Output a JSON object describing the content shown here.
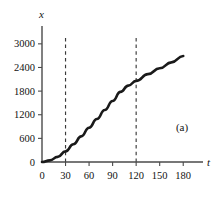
{
  "figure": {
    "panel_label": "(a)",
    "background_color": "#ffffff",
    "curve_color": "#1a1a1a",
    "axis_color": "#4a4a4a",
    "marker_color": "#3a3a3a"
  },
  "chart_data": {
    "type": "line",
    "title": "",
    "subtitle": "",
    "xlabel": "t",
    "ylabel": "x",
    "annotation": "(a)",
    "grid": false,
    "legend": false,
    "legend_position": "none",
    "xlim": [
      0,
      195
    ],
    "ylim": [
      0,
      3250
    ],
    "xticks": [
      0,
      30,
      60,
      90,
      120,
      150,
      180
    ],
    "xtick_labels": [
      "0",
      "30",
      "60",
      "90",
      "120",
      "150",
      "180"
    ],
    "yticks": [
      0,
      600,
      1200,
      1800,
      2400,
      3000
    ],
    "ytick_labels": [
      "0",
      "600",
      "1200",
      "1800",
      "2400",
      "3000"
    ],
    "series": [
      {
        "name": "x(t)",
        "x": [
          0,
          10,
          20,
          30,
          40,
          50,
          60,
          70,
          80,
          90,
          100,
          110,
          120,
          135,
          150,
          165,
          180
        ],
        "values": [
          0,
          40,
          130,
          270,
          450,
          650,
          870,
          1090,
          1320,
          1550,
          1780,
          1940,
          2060,
          2230,
          2380,
          2530,
          2690
        ]
      }
    ],
    "vertical_markers": [
      {
        "x": 30,
        "style": "dashed",
        "y_top": 3150
      },
      {
        "x": 120,
        "style": "dashed",
        "y_top": 3150
      }
    ]
  }
}
